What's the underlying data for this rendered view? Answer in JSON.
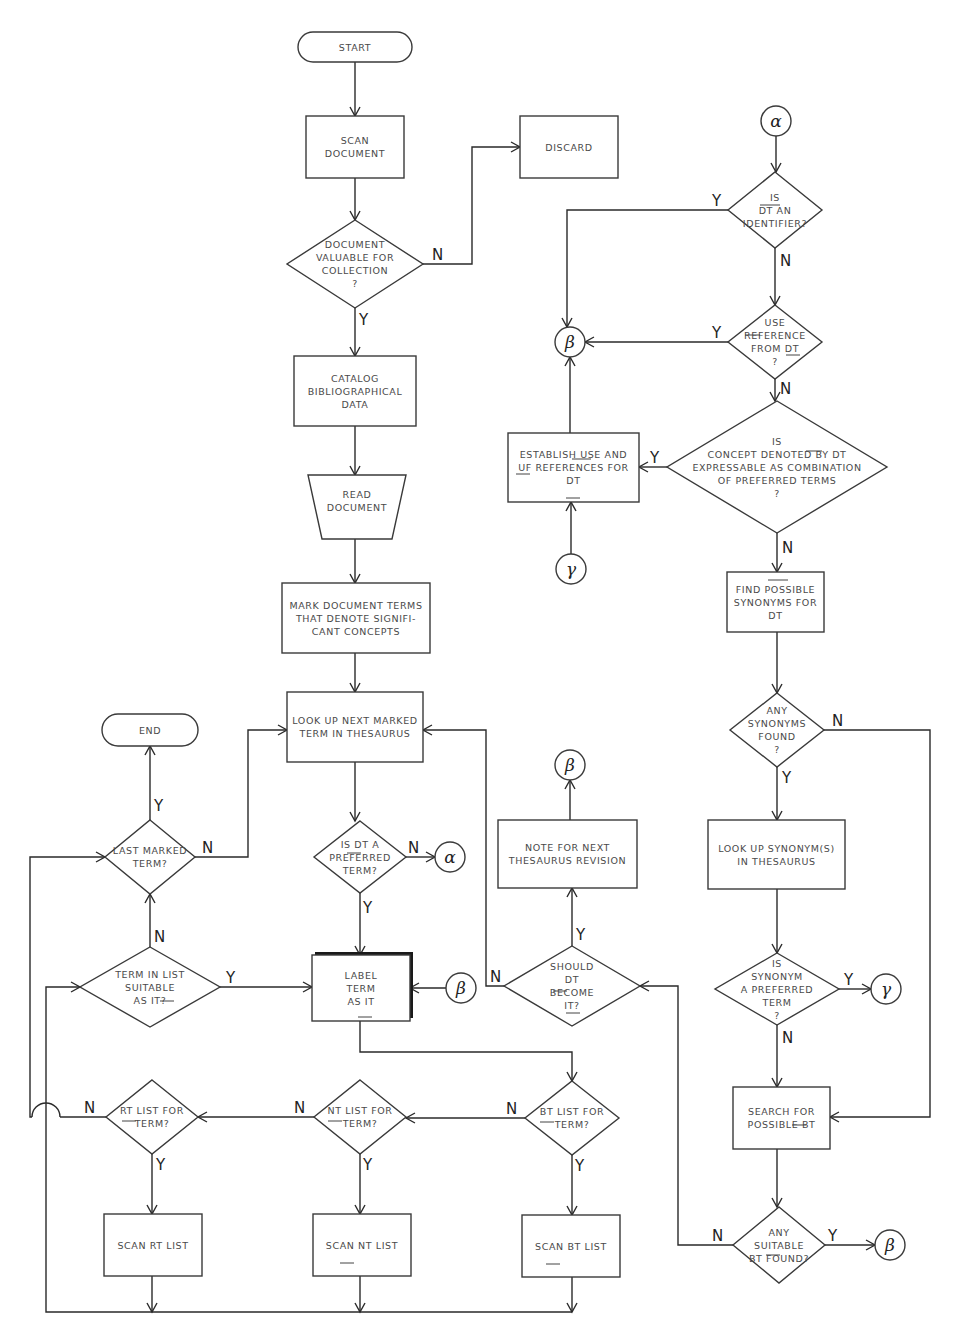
{
  "diagram": {
    "colors": {
      "line": "#2a2a2a",
      "text": "#4a4a4a",
      "background": "#ffffff"
    },
    "nodes": [
      {
        "id": "start",
        "type": "terminal",
        "x": 298,
        "y": 32,
        "w": 114,
        "h": 30,
        "lines": [
          "START"
        ]
      },
      {
        "id": "scan_doc",
        "type": "process",
        "x": 306,
        "y": 116,
        "w": 98,
        "h": 62,
        "lines": [
          "SCAN",
          "DOCUMENT"
        ]
      },
      {
        "id": "discard",
        "type": "process",
        "x": 520,
        "y": 116,
        "w": 98,
        "h": 62,
        "lines": [
          "DISCARD"
        ]
      },
      {
        "id": "doc_valuable",
        "type": "decision",
        "cx": 355,
        "cy": 264,
        "hw": 68,
        "hh": 44,
        "lines": [
          "DOCUMENT",
          "VALUABLE FOR",
          "COLLECTION",
          "?"
        ]
      },
      {
        "id": "catalog",
        "type": "process",
        "x": 294,
        "y": 356,
        "w": 122,
        "h": 70,
        "lines": [
          "CATALOG",
          "BIBLIOGRAPHICAL",
          "DATA"
        ]
      },
      {
        "id": "read_doc",
        "type": "manual",
        "x": 308,
        "y": 475,
        "w": 98,
        "h": 64,
        "lines": [
          "READ",
          "DOCUMENT"
        ]
      },
      {
        "id": "mark_terms",
        "type": "process",
        "x": 282,
        "y": 583,
        "w": 148,
        "h": 70,
        "lines": [
          "MARK DOCUMENT TERMS",
          "THAT DENOTE SIGNIFI-",
          "CANT CONCEPTS"
        ]
      },
      {
        "id": "lookup_next",
        "type": "process",
        "x": 287,
        "y": 692,
        "w": 136,
        "h": 70,
        "lines": [
          "LOOK UP NEXT MARKED",
          "TERM IN THESAURUS"
        ]
      },
      {
        "id": "end",
        "type": "terminal",
        "x": 102,
        "y": 714,
        "w": 96,
        "h": 32,
        "lines": [
          "END"
        ]
      },
      {
        "id": "last_marked",
        "type": "decision",
        "cx": 150,
        "cy": 857,
        "hw": 45,
        "hh": 37,
        "lines": [
          "LAST MARKED",
          "TERM?"
        ]
      },
      {
        "id": "is_preferred",
        "type": "decision",
        "cx": 360,
        "cy": 857,
        "hw": 46,
        "hh": 36,
        "lines": [
          "IS DT A",
          "PREFERRED",
          "TERM?"
        ]
      },
      {
        "id": "term_suitable",
        "type": "decision",
        "cx": 150,
        "cy": 987,
        "hw": 70,
        "hh": 40,
        "lines": [
          "TERM IN LIST",
          "SUITABLE",
          "AS IT?"
        ]
      },
      {
        "id": "label_it",
        "type": "process_bold",
        "x": 312,
        "y": 955,
        "w": 98,
        "h": 66,
        "lines": [
          "LABEL",
          "TERM",
          "AS IT"
        ]
      },
      {
        "id": "should_become",
        "type": "decision",
        "cx": 572,
        "cy": 986,
        "hw": 68,
        "hh": 40,
        "lines": [
          "SHOULD",
          "DT",
          "BECOME",
          "IT?"
        ]
      },
      {
        "id": "note_revision",
        "type": "process",
        "x": 498,
        "y": 820,
        "w": 139,
        "h": 68,
        "lines": [
          "NOTE FOR NEXT",
          "THESAURUS REVISION"
        ]
      },
      {
        "id": "is_identifier",
        "type": "decision",
        "cx": 775,
        "cy": 210,
        "hw": 47,
        "hh": 38,
        "lines": [
          "IS",
          "DT AN",
          "IDENTIFIER?"
        ]
      },
      {
        "id": "use_reference",
        "type": "decision",
        "cx": 775,
        "cy": 342,
        "hw": 47,
        "hh": 37,
        "lines": [
          "USE",
          "REFERENCE",
          "FROM DT",
          "?"
        ]
      },
      {
        "id": "concept_expressable",
        "type": "decision",
        "cx": 777,
        "cy": 467,
        "hw": 110,
        "hh": 66,
        "lines": [
          "IS",
          "CONCEPT DENOTED BY DT",
          "EXPRESSABLE AS COMBINATION",
          "OF PREFERRED TERMS",
          "?"
        ]
      },
      {
        "id": "establish_use",
        "type": "process",
        "x": 508,
        "y": 433,
        "w": 131,
        "h": 69,
        "lines": [
          "ESTABLISH USE AND",
          "UF REFERENCES FOR",
          "DT"
        ]
      },
      {
        "id": "find_synonyms",
        "type": "process",
        "x": 727,
        "y": 572,
        "w": 97,
        "h": 60,
        "lines": [
          "FIND POSSIBLE",
          "SYNONYMS FOR",
          "DT"
        ]
      },
      {
        "id": "any_synonyms",
        "type": "decision",
        "cx": 777,
        "cy": 730,
        "hw": 47,
        "hh": 37,
        "lines": [
          "ANY",
          "SYNONYMS",
          "FOUND",
          "?"
        ]
      },
      {
        "id": "lookup_synonyms",
        "type": "process",
        "x": 708,
        "y": 820,
        "w": 137,
        "h": 69,
        "lines": [
          "LOOK UP SYNONYM(S)",
          "IN THESAURUS"
        ]
      },
      {
        "id": "is_synonym_pref",
        "type": "decision",
        "cx": 777,
        "cy": 989,
        "hw": 62,
        "hh": 36,
        "lines": [
          "IS",
          "SYNONYM",
          "A PREFERRED",
          "TERM",
          "?"
        ]
      },
      {
        "id": "search_bt",
        "type": "process",
        "x": 733,
        "y": 1087,
        "w": 97,
        "h": 62,
        "lines": [
          "SEARCH FOR",
          "POSSIBLE BT"
        ]
      },
      {
        "id": "any_suitable_bt",
        "type": "decision",
        "cx": 779,
        "cy": 1245,
        "hw": 46,
        "hh": 38,
        "lines": [
          "ANY",
          "SUITABLE",
          "BT FOUND?"
        ]
      },
      {
        "id": "rt_list",
        "type": "decision",
        "cx": 152,
        "cy": 1117,
        "hw": 46,
        "hh": 37,
        "lines": [
          "RT LIST FOR",
          "TERM?"
        ]
      },
      {
        "id": "nt_list",
        "type": "decision",
        "cx": 360,
        "cy": 1117,
        "hw": 46,
        "hh": 37,
        "lines": [
          "NT LIST FOR",
          "TERM?"
        ]
      },
      {
        "id": "bt_list",
        "type": "decision",
        "cx": 572,
        "cy": 1118,
        "hw": 47,
        "hh": 37,
        "lines": [
          "BT LIST FOR",
          "TERM?"
        ]
      },
      {
        "id": "scan_rt",
        "type": "process",
        "x": 104,
        "y": 1214,
        "w": 98,
        "h": 62,
        "lines": [
          "SCAN RT LIST"
        ]
      },
      {
        "id": "scan_nt",
        "type": "process",
        "x": 313,
        "y": 1214,
        "w": 98,
        "h": 62,
        "lines": [
          "SCAN NT LIST"
        ]
      },
      {
        "id": "scan_bt",
        "type": "process",
        "x": 522,
        "y": 1215,
        "w": 98,
        "h": 62,
        "lines": [
          "SCAN BT LIST"
        ]
      }
    ],
    "connectors": [
      {
        "id": "alpha_top",
        "cx": 776,
        "cy": 121,
        "r": 15,
        "symbol": "α"
      },
      {
        "id": "beta_left",
        "cx": 570,
        "cy": 342,
        "r": 15,
        "symbol": "β"
      },
      {
        "id": "gamma_left",
        "cx": 571,
        "cy": 569,
        "r": 15,
        "symbol": "γ"
      },
      {
        "id": "alpha_right",
        "cx": 450,
        "cy": 857,
        "r": 15,
        "symbol": "α"
      },
      {
        "id": "beta_top",
        "cx": 570,
        "cy": 765,
        "r": 15,
        "symbol": "β"
      },
      {
        "id": "beta_label",
        "cx": 461,
        "cy": 988,
        "r": 15,
        "symbol": "β"
      },
      {
        "id": "gamma_right",
        "cx": 886,
        "cy": 989,
        "r": 15,
        "symbol": "γ"
      },
      {
        "id": "beta_bottom",
        "cx": 890,
        "cy": 1245,
        "r": 15,
        "symbol": "β"
      }
    ],
    "edges": [
      {
        "pts": [
          [
            355,
            62
          ],
          [
            355,
            116
          ]
        ],
        "arrow": true
      },
      {
        "pts": [
          [
            355,
            178
          ],
          [
            355,
            220
          ]
        ],
        "arrow": true
      },
      {
        "pts": [
          [
            423,
            264
          ],
          [
            472,
            264
          ],
          [
            472,
            147
          ],
          [
            520,
            147
          ]
        ],
        "arrow": true,
        "label": "N",
        "lx": 432,
        "ly": 260
      },
      {
        "pts": [
          [
            355,
            308
          ],
          [
            355,
            356
          ]
        ],
        "arrow": true,
        "label": "Y",
        "lx": 359,
        "ly": 325
      },
      {
        "pts": [
          [
            355,
            426
          ],
          [
            355,
            475
          ]
        ],
        "arrow": true
      },
      {
        "pts": [
          [
            355,
            539
          ],
          [
            355,
            583
          ]
        ],
        "arrow": true
      },
      {
        "pts": [
          [
            355,
            653
          ],
          [
            355,
            692
          ]
        ],
        "arrow": true
      },
      {
        "pts": [
          [
            355,
            762
          ],
          [
            355,
            821
          ]
        ],
        "arrow": true
      },
      {
        "pts": [
          [
            406,
            857
          ],
          [
            435,
            857
          ]
        ],
        "arrow": true,
        "label": "N",
        "lx": 408,
        "ly": 853
      },
      {
        "pts": [
          [
            360,
            893
          ],
          [
            360,
            955
          ]
        ],
        "arrow": true,
        "label": "Y",
        "lx": 363,
        "ly": 913
      },
      {
        "pts": [
          [
            195,
            857
          ],
          [
            248,
            857
          ],
          [
            248,
            730
          ],
          [
            287,
            730
          ]
        ],
        "arrow": true,
        "label": "N",
        "lx": 202,
        "ly": 853
      },
      {
        "pts": [
          [
            150,
            820
          ],
          [
            150,
            746
          ]
        ],
        "arrow": true,
        "label": "Y",
        "lx": 154,
        "ly": 811
      },
      {
        "pts": [
          [
            150,
            947
          ],
          [
            150,
            894
          ]
        ],
        "arrow": true,
        "label": "N",
        "lx": 154,
        "ly": 942
      },
      {
        "pts": [
          [
            220,
            987
          ],
          [
            312,
            987
          ]
        ],
        "arrow": true,
        "label": "Y",
        "lx": 226,
        "ly": 983
      },
      {
        "pts": [
          [
            446,
            988
          ],
          [
            410,
            988
          ]
        ],
        "arrow": true
      },
      {
        "pts": [
          [
            360,
            1021
          ],
          [
            360,
            1052
          ],
          [
            572,
            1052
          ],
          [
            572,
            1081
          ]
        ],
        "arrow": true
      },
      {
        "pts": [
          [
            525,
            1118
          ],
          [
            406,
            1118
          ]
        ],
        "arrow": true,
        "label": "N",
        "lx": 506,
        "ly": 1114
      },
      {
        "pts": [
          [
            314,
            1117
          ],
          [
            198,
            1117
          ]
        ],
        "arrow": true,
        "label": "N",
        "lx": 294,
        "ly": 1113
      },
      {
        "pts": [
          [
            106,
            1117
          ],
          [
            60,
            1117
          ]
        ],
        "arrow": false,
        "label": "N",
        "lx": 84,
        "ly": 1113
      },
      {
        "pts": [
          [
            32,
            1117
          ],
          [
            30,
            1117
          ],
          [
            30,
            857
          ],
          [
            105,
            857
          ]
        ],
        "arrow": true
      },
      {
        "pts": [
          [
            152,
            1154
          ],
          [
            152,
            1214
          ]
        ],
        "arrow": true,
        "label": "Y",
        "lx": 156,
        "ly": 1170
      },
      {
        "pts": [
          [
            360,
            1154
          ],
          [
            360,
            1214
          ]
        ],
        "arrow": true,
        "label": "Y",
        "lx": 363,
        "ly": 1170
      },
      {
        "pts": [
          [
            572,
            1155
          ],
          [
            572,
            1215
          ]
        ],
        "arrow": true,
        "label": "Y",
        "lx": 575,
        "ly": 1171
      },
      {
        "pts": [
          [
            152,
            1276
          ],
          [
            152,
            1312
          ]
        ],
        "arrow": true
      },
      {
        "pts": [
          [
            360,
            1276
          ],
          [
            360,
            1312
          ]
        ],
        "arrow": true
      },
      {
        "pts": [
          [
            572,
            1277
          ],
          [
            572,
            1312
          ]
        ],
        "arrow": true
      },
      {
        "pts": [
          [
            572,
            1312
          ],
          [
            46,
            1312
          ],
          [
            46,
            987
          ],
          [
            80,
            987
          ]
        ],
        "arrow": true
      },
      {
        "pts": [
          [
            504,
            986
          ],
          [
            486,
            986
          ],
          [
            486,
            730
          ],
          [
            423,
            730
          ]
        ],
        "arrow": true,
        "label": "N",
        "lx": 490,
        "ly": 982
      },
      {
        "pts": [
          [
            572,
            946
          ],
          [
            572,
            888
          ]
        ],
        "arrow": true,
        "label": "Y",
        "lx": 576,
        "ly": 940
      },
      {
        "pts": [
          [
            570,
            820
          ],
          [
            570,
            780
          ]
        ],
        "arrow": true
      },
      {
        "pts": [
          [
            776,
            136
          ],
          [
            776,
            172
          ]
        ],
        "arrow": true
      },
      {
        "pts": [
          [
            728,
            210
          ],
          [
            567,
            210
          ],
          [
            567,
            327
          ]
        ],
        "arrow": true,
        "label": "Y",
        "lx": 712,
        "ly": 206
      },
      {
        "pts": [
          [
            775,
            248
          ],
          [
            775,
            305
          ]
        ],
        "arrow": true,
        "label": "N",
        "lx": 780,
        "ly": 266
      },
      {
        "pts": [
          [
            728,
            342
          ],
          [
            585,
            342
          ]
        ],
        "arrow": true,
        "label": "Y",
        "lx": 712,
        "ly": 338
      },
      {
        "pts": [
          [
            775,
            379
          ],
          [
            775,
            401
          ]
        ],
        "arrow": true,
        "label": "N",
        "lx": 780,
        "ly": 394
      },
      {
        "pts": [
          [
            570,
            433
          ],
          [
            570,
            357
          ]
        ],
        "arrow": true
      },
      {
        "pts": [
          [
            667,
            467
          ],
          [
            639,
            467
          ]
        ],
        "arrow": true,
        "label": "Y",
        "lx": 650,
        "ly": 463
      },
      {
        "pts": [
          [
            571,
            554
          ],
          [
            571,
            502
          ]
        ],
        "arrow": true
      },
      {
        "pts": [
          [
            777,
            533
          ],
          [
            777,
            572
          ]
        ],
        "arrow": true,
        "label": "N",
        "lx": 782,
        "ly": 553
      },
      {
        "pts": [
          [
            777,
            632
          ],
          [
            777,
            693
          ]
        ],
        "arrow": true
      },
      {
        "pts": [
          [
            824,
            730
          ],
          [
            930,
            730
          ],
          [
            930,
            1117
          ],
          [
            830,
            1117
          ]
        ],
        "arrow": true,
        "label": "N",
        "lx": 832,
        "ly": 726
      },
      {
        "pts": [
          [
            777,
            767
          ],
          [
            777,
            820
          ]
        ],
        "arrow": true,
        "label": "Y",
        "lx": 782,
        "ly": 783
      },
      {
        "pts": [
          [
            777,
            889
          ],
          [
            777,
            953
          ]
        ],
        "arrow": true
      },
      {
        "pts": [
          [
            839,
            989
          ],
          [
            871,
            989
          ]
        ],
        "arrow": true,
        "label": "Y",
        "lx": 844,
        "ly": 985
      },
      {
        "pts": [
          [
            777,
            1025
          ],
          [
            777,
            1087
          ]
        ],
        "arrow": true,
        "label": "N",
        "lx": 782,
        "ly": 1043
      },
      {
        "pts": [
          [
            777,
            1149
          ],
          [
            777,
            1207
          ]
        ],
        "arrow": true
      },
      {
        "pts": [
          [
            825,
            1245
          ],
          [
            875,
            1245
          ]
        ],
        "arrow": true,
        "label": "Y",
        "lx": 828,
        "ly": 1241
      },
      {
        "pts": [
          [
            733,
            1245
          ],
          [
            678,
            1245
          ],
          [
            678,
            986
          ],
          [
            640,
            986
          ]
        ],
        "arrow": true,
        "label": "N",
        "lx": 712,
        "ly": 1241
      }
    ],
    "jumps": [
      {
        "x": 46,
        "y": 1117,
        "r": 14
      }
    ]
  }
}
